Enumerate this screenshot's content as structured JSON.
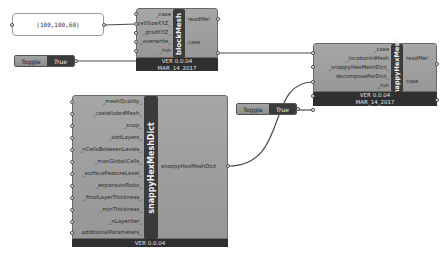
{
  "panel": {
    "value": "(100,100,60)"
  },
  "toggles": [
    {
      "label": "Toggle",
      "value": "True"
    },
    {
      "label": "Toggle",
      "value": "True"
    }
  ],
  "components": {
    "blockMesh": {
      "title": "blockMesh",
      "inputs": [
        "_case",
        "cellSizeXYZ_",
        "_gradXYZ_",
        "_overwrite_",
        "_run"
      ],
      "outputs": [
        "readMe!",
        "case"
      ],
      "version": "VER 0.0.04",
      "date": "MAR_14_2017"
    },
    "snappyHexMesh": {
      "title": "snappyHexMesh",
      "inputs": [
        "_case",
        "_locationInMesh",
        "_snappyHexMeshDict_",
        "decomposeParDict_",
        "_run"
      ],
      "outputs": [
        "readMe!",
        "case"
      ],
      "version": "VER 0.0.04",
      "date": "MAR_14_2017"
    },
    "snappyHexMeshDict": {
      "title": "snappyHexMeshDict",
      "inputs": [
        "_meshQuality_",
        "_castellatedMesh_",
        "_snap_",
        "_addLayers_",
        "_nCellsBetweenLevels_",
        "_maxGlobalCells_",
        "_surfaceFeatureLevel_",
        "_expansionRatio_",
        "_finalLayerThickness_",
        "_minThickness_",
        "_nLayerIter_",
        "additionalParameters_"
      ],
      "outputs": [
        "snappyHexMeshDict"
      ],
      "version": "VER 0.0.04"
    }
  },
  "colors": {
    "component_body": "#9e9e9e",
    "component_strip": "#3a3a3a",
    "footer": "#2f2f2f",
    "wire": "#4a4a4a"
  }
}
